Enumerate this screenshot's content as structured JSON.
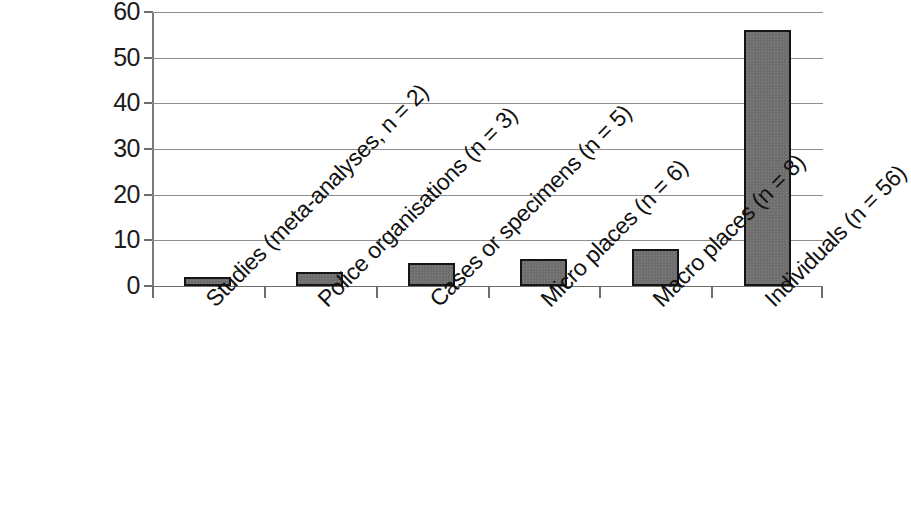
{
  "chart_data": {
    "type": "bar",
    "title": "",
    "subtitle": "",
    "xlabel": "",
    "ylabel": "",
    "categories": [
      "Studies (meta-analyses, n = 2)",
      "Police organisations (n = 3)",
      "Cases or specimens (n = 5)",
      "Micro places (n = 6)",
      "Macro places (n = 8)",
      "Individuals (n = 56)"
    ],
    "values": [
      2,
      3,
      5,
      6,
      8,
      56
    ],
    "ylim": [
      0,
      60
    ],
    "y_ticks": [
      0,
      10,
      20,
      30,
      40,
      50,
      60
    ],
    "y_tick_labels": [
      "0",
      "10",
      "20",
      "30",
      "40",
      "50",
      "60"
    ],
    "grid": true,
    "legend": false,
    "legend_position": "none",
    "bar_fill_color": "#6e6e6e",
    "bar_border_color": "#151515",
    "gridline_color": "#8e8e8e",
    "axis_color": "#6d6d6d",
    "background_color": "#ffffff",
    "x_label_rotation_degrees": -45
  },
  "axes": {
    "y": {
      "ticks": [
        {
          "value": 60,
          "label": "60"
        },
        {
          "value": 50,
          "label": "50"
        },
        {
          "value": 40,
          "label": "40"
        },
        {
          "value": 30,
          "label": "30"
        },
        {
          "value": 20,
          "label": "20"
        },
        {
          "value": 10,
          "label": "10"
        },
        {
          "value": 0,
          "label": "0"
        }
      ]
    },
    "x": {
      "ticks": [
        {
          "label": "Studies (meta-analyses, n = 2)"
        },
        {
          "label": "Police organisations (n = 3)"
        },
        {
          "label": "Cases or specimens (n = 5)"
        },
        {
          "label": "Micro places (n = 6)"
        },
        {
          "label": "Macro places (n = 8)"
        },
        {
          "label": "Individuals (n = 56)"
        }
      ]
    }
  }
}
